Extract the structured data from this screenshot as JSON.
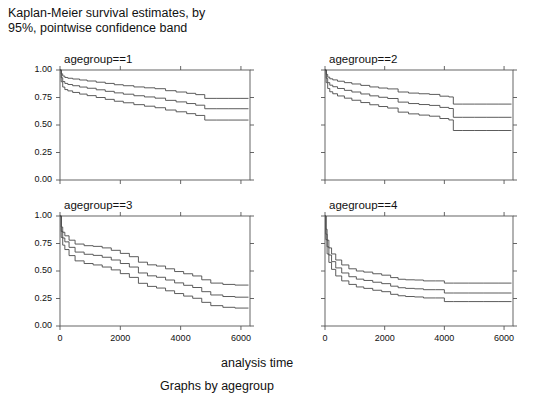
{
  "figure": {
    "title": "Kaplan-Meier survival estimates, by\n95%, pointwise confidence band",
    "xlabel": "analysis time",
    "footer": "Graphs by agegroup"
  },
  "axes": {
    "y_ticks": [
      "0.00",
      "0.25",
      "0.50",
      "0.75",
      "1.00"
    ],
    "x_ticks": [
      "0",
      "2000",
      "4000",
      "6000"
    ]
  },
  "panels": [
    {
      "title": "agegroup==1"
    },
    {
      "title": "agegroup==2"
    },
    {
      "title": "agegroup==3"
    },
    {
      "title": "agegroup==4"
    }
  ],
  "chart_data": {
    "type": "line",
    "title": "Kaplan-Meier survival estimates, by 95%, pointwise confidence band",
    "subtitle": "Graphs by agegroup",
    "xlabel": "analysis time",
    "ylabel": "",
    "xlim": [
      0,
      6300
    ],
    "ylim": [
      0,
      1
    ],
    "xticks": [
      0,
      2000,
      4000,
      6000
    ],
    "yticks": [
      0,
      0.25,
      0.5,
      0.75,
      1
    ],
    "grid": false,
    "legend": "none",
    "layout": "2x2 small multiples by agegroup",
    "series_roles": [
      "upper 95% confidence limit",
      "survivor function estimate",
      "lower 95% confidence limit"
    ],
    "panels": [
      {
        "name": "agegroup==1",
        "series": [
          {
            "name": "upper",
            "x": [
              0,
              40,
              90,
              160,
              260,
              420,
              650,
              900,
              1200,
              1500,
              1800,
              2100,
              2450,
              2800,
              3150,
              3500,
              3850,
              4200,
              4500,
              4800,
              5200,
              5600,
              6000,
              6250
            ],
            "values": [
              1.0,
              0.965,
              0.945,
              0.932,
              0.925,
              0.918,
              0.909,
              0.9,
              0.889,
              0.878,
              0.866,
              0.857,
              0.846,
              0.838,
              0.83,
              0.812,
              0.8,
              0.788,
              0.776,
              0.742,
              0.742,
              0.742,
              0.742,
              0.742
            ]
          },
          {
            "name": "estimate",
            "x": [
              0,
              40,
              90,
              160,
              260,
              420,
              650,
              900,
              1200,
              1500,
              1800,
              2100,
              2450,
              2800,
              3150,
              3500,
              3850,
              4200,
              4500,
              4800,
              5200,
              5600,
              6000,
              6250
            ],
            "values": [
              1.0,
              0.93,
              0.895,
              0.878,
              0.868,
              0.857,
              0.845,
              0.834,
              0.82,
              0.806,
              0.792,
              0.78,
              0.766,
              0.755,
              0.744,
              0.724,
              0.71,
              0.695,
              0.68,
              0.648,
              0.648,
              0.648,
              0.648,
              0.648
            ]
          },
          {
            "name": "lower",
            "x": [
              0,
              40,
              90,
              160,
              260,
              420,
              650,
              900,
              1200,
              1500,
              1800,
              2100,
              2450,
              2800,
              3150,
              3500,
              3850,
              4200,
              4500,
              4800,
              5200,
              5600,
              6000,
              6250
            ],
            "values": [
              1.0,
              0.893,
              0.845,
              0.822,
              0.81,
              0.796,
              0.781,
              0.767,
              0.75,
              0.733,
              0.716,
              0.702,
              0.685,
              0.671,
              0.657,
              0.636,
              0.62,
              0.603,
              0.587,
              0.545,
              0.545,
              0.545,
              0.545,
              0.545
            ]
          }
        ]
      },
      {
        "name": "agegroup==2",
        "series": [
          {
            "name": "upper",
            "x": [
              0,
              40,
              90,
              160,
              260,
              420,
              650,
              900,
              1200,
              1500,
              1800,
              2100,
              2450,
              2800,
              3150,
              3500,
              3850,
              4150,
              4300,
              4600,
              5000,
              5400,
              5800,
              6250
            ],
            "values": [
              1.0,
              0.96,
              0.935,
              0.92,
              0.91,
              0.898,
              0.885,
              0.873,
              0.86,
              0.846,
              0.836,
              0.828,
              0.8,
              0.79,
              0.784,
              0.778,
              0.762,
              0.755,
              0.69,
              0.69,
              0.69,
              0.69,
              0.69,
              0.69
            ]
          },
          {
            "name": "estimate",
            "x": [
              0,
              40,
              90,
              160,
              260,
              420,
              650,
              900,
              1200,
              1500,
              1800,
              2100,
              2450,
              2800,
              3150,
              3500,
              3850,
              4150,
              4300,
              4600,
              5000,
              5400,
              5800,
              6250
            ],
            "values": [
              1.0,
              0.925,
              0.885,
              0.862,
              0.848,
              0.832,
              0.815,
              0.8,
              0.782,
              0.765,
              0.752,
              0.741,
              0.708,
              0.695,
              0.686,
              0.678,
              0.66,
              0.65,
              0.57,
              0.57,
              0.57,
              0.57,
              0.57,
              0.57
            ]
          },
          {
            "name": "lower",
            "x": [
              0,
              40,
              90,
              160,
              260,
              420,
              650,
              900,
              1200,
              1500,
              1800,
              2100,
              2450,
              2800,
              3150,
              3500,
              3850,
              4150,
              4300,
              4600,
              5000,
              5400,
              5800,
              6250
            ],
            "values": [
              1.0,
              0.885,
              0.832,
              0.802,
              0.784,
              0.764,
              0.744,
              0.725,
              0.704,
              0.684,
              0.668,
              0.654,
              0.617,
              0.601,
              0.59,
              0.58,
              0.559,
              0.546,
              0.45,
              0.45,
              0.45,
              0.45,
              0.45,
              0.45
            ]
          }
        ]
      },
      {
        "name": "agegroup==3",
        "series": [
          {
            "name": "upper",
            "x": [
              0,
              40,
              90,
              160,
              300,
              500,
              800,
              1100,
              1400,
              1700,
              2000,
              2300,
              2600,
              2900,
              3200,
              3500,
              3800,
              4100,
              4400,
              4700,
              5000,
              5400,
              5800,
              6250
            ],
            "values": [
              1.0,
              0.9,
              0.852,
              0.82,
              0.78,
              0.745,
              0.73,
              0.724,
              0.71,
              0.688,
              0.66,
              0.63,
              0.58,
              0.556,
              0.545,
              0.52,
              0.495,
              0.475,
              0.455,
              0.42,
              0.39,
              0.378,
              0.372,
              0.372
            ]
          },
          {
            "name": "estimate",
            "x": [
              0,
              40,
              90,
              160,
              300,
              500,
              800,
              1100,
              1400,
              1700,
              2000,
              2300,
              2600,
              2900,
              3200,
              3500,
              3800,
              4100,
              4400,
              4700,
              5000,
              5400,
              5800,
              6250
            ],
            "values": [
              1.0,
              0.86,
              0.8,
              0.765,
              0.715,
              0.672,
              0.652,
              0.642,
              0.625,
              0.6,
              0.568,
              0.536,
              0.482,
              0.456,
              0.443,
              0.418,
              0.392,
              0.37,
              0.35,
              0.312,
              0.282,
              0.268,
              0.262,
              0.262
            ]
          },
          {
            "name": "lower",
            "x": [
              0,
              40,
              90,
              160,
              300,
              500,
              800,
              1100,
              1400,
              1700,
              2000,
              2300,
              2600,
              2900,
              3200,
              3500,
              3800,
              4100,
              4400,
              4700,
              5000,
              5400,
              5800,
              6250
            ],
            "values": [
              1.0,
              0.805,
              0.735,
              0.695,
              0.64,
              0.592,
              0.568,
              0.555,
              0.536,
              0.51,
              0.476,
              0.442,
              0.388,
              0.36,
              0.345,
              0.32,
              0.295,
              0.272,
              0.252,
              0.215,
              0.185,
              0.17,
              0.163,
              0.163
            ]
          }
        ]
      },
      {
        "name": "agegroup==4",
        "series": [
          {
            "name": "upper",
            "x": [
              0,
              30,
              70,
              130,
              220,
              360,
              560,
              800,
              1050,
              1300,
              1600,
              1900,
              2200,
              2450,
              2700,
              3000,
              3300,
              3700,
              4000,
              4300,
              4800,
              5300,
              5800,
              6250
            ],
            "values": [
              1.0,
              0.88,
              0.78,
              0.71,
              0.655,
              0.6,
              0.555,
              0.52,
              0.5,
              0.49,
              0.475,
              0.462,
              0.44,
              0.425,
              0.42,
              0.418,
              0.41,
              0.41,
              0.39,
              0.39,
              0.39,
              0.39,
              0.39,
              0.39
            ]
          },
          {
            "name": "estimate",
            "x": [
              0,
              30,
              70,
              130,
              220,
              360,
              560,
              800,
              1050,
              1300,
              1600,
              1900,
              2200,
              2450,
              2700,
              3000,
              3300,
              3700,
              4000,
              4300,
              4800,
              5300,
              5800,
              6250
            ],
            "values": [
              1.0,
              0.835,
              0.72,
              0.645,
              0.585,
              0.528,
              0.482,
              0.448,
              0.426,
              0.414,
              0.398,
              0.385,
              0.362,
              0.348,
              0.342,
              0.338,
              0.33,
              0.33,
              0.3,
              0.3,
              0.3,
              0.3,
              0.3,
              0.3
            ]
          },
          {
            "name": "lower",
            "x": [
              0,
              30,
              70,
              130,
              220,
              360,
              560,
              800,
              1050,
              1300,
              1600,
              1900,
              2200,
              2450,
              2700,
              3000,
              3300,
              3700,
              4000,
              4300,
              4800,
              5300,
              5800,
              6250
            ],
            "values": [
              1.0,
              0.785,
              0.655,
              0.578,
              0.515,
              0.455,
              0.41,
              0.378,
              0.355,
              0.342,
              0.325,
              0.312,
              0.288,
              0.275,
              0.268,
              0.264,
              0.255,
              0.255,
              0.222,
              0.222,
              0.222,
              0.222,
              0.222,
              0.222
            ]
          }
        ]
      }
    ]
  }
}
